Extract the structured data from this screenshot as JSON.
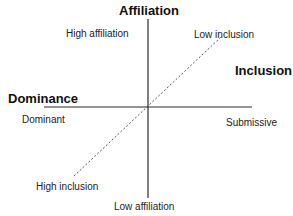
{
  "diagram": {
    "axes": {
      "vertical": {
        "title": "Affiliation",
        "top_label": "High affiliation",
        "bottom_label": "Low affiliation"
      },
      "horizontal": {
        "title": "Dominance",
        "left_label": "Dominant",
        "right_label": "Submissive"
      },
      "diagonal": {
        "title": "Inclusion",
        "top_label": "Low inclusion",
        "bottom_label": "High inclusion",
        "style": "dashed"
      }
    },
    "colors": {
      "line": "#2a2a2a",
      "text": "#222222"
    }
  }
}
